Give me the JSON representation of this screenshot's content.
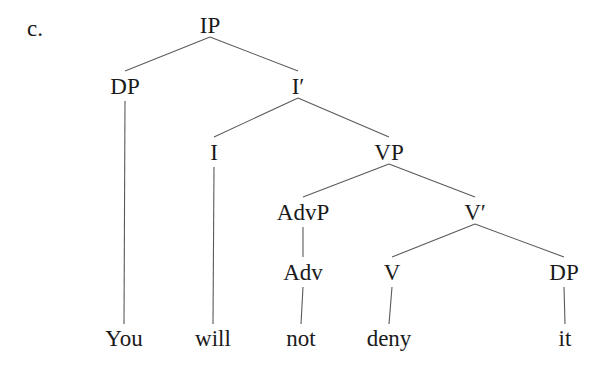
{
  "example_label": "c.",
  "chart_data": {
    "type": "tree",
    "title": "c.",
    "nodes": [
      {
        "id": "IP",
        "label": "IP",
        "x": 210,
        "y": 25
      },
      {
        "id": "DP1",
        "label": "DP",
        "x": 125,
        "y": 86
      },
      {
        "id": "Ibar",
        "label": "I′",
        "x": 298,
        "y": 86
      },
      {
        "id": "I",
        "label": "I",
        "x": 214,
        "y": 152
      },
      {
        "id": "VP",
        "label": "VP",
        "x": 389,
        "y": 152
      },
      {
        "id": "AdvP",
        "label": "AdvP",
        "x": 303,
        "y": 212
      },
      {
        "id": "Vbar",
        "label": "V′",
        "x": 475,
        "y": 212
      },
      {
        "id": "Adv",
        "label": "Adv",
        "x": 303,
        "y": 272
      },
      {
        "id": "V",
        "label": "V",
        "x": 392,
        "y": 272
      },
      {
        "id": "DP2",
        "label": "DP",
        "x": 564,
        "y": 272
      },
      {
        "id": "You",
        "label": "You",
        "x": 124,
        "y": 338
      },
      {
        "id": "will",
        "label": "will",
        "x": 213,
        "y": 338
      },
      {
        "id": "not",
        "label": "not",
        "x": 301,
        "y": 338
      },
      {
        "id": "deny",
        "label": "deny",
        "x": 389,
        "y": 338
      },
      {
        "id": "it",
        "label": "it",
        "x": 565,
        "y": 338
      }
    ],
    "edges": [
      [
        "IP",
        "DP1"
      ],
      [
        "IP",
        "Ibar"
      ],
      [
        "Ibar",
        "I"
      ],
      [
        "Ibar",
        "VP"
      ],
      [
        "VP",
        "AdvP"
      ],
      [
        "VP",
        "Vbar"
      ],
      [
        "AdvP",
        "Adv"
      ],
      [
        "Vbar",
        "V"
      ],
      [
        "Vbar",
        "DP2"
      ],
      [
        "DP1",
        "You"
      ],
      [
        "I",
        "will"
      ],
      [
        "Adv",
        "not"
      ],
      [
        "V",
        "deny"
      ],
      [
        "DP2",
        "it"
      ]
    ]
  }
}
